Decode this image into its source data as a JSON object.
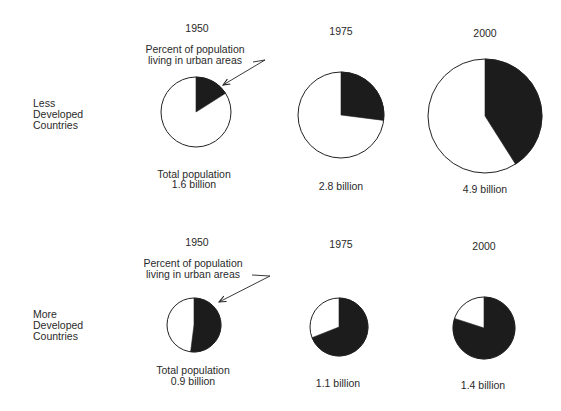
{
  "chart_data": {
    "type": "pie",
    "title": "",
    "annotation": "Percent of population living in urban areas",
    "groups": [
      {
        "name": "Less Developed Countries",
        "pies": [
          {
            "year": "1950",
            "total_population_billion": 1.6,
            "urban_percent": 16,
            "label": "Total population 1.6 billion"
          },
          {
            "year": "1975",
            "total_population_billion": 2.8,
            "urban_percent": 27,
            "label": "2.8 billion"
          },
          {
            "year": "2000",
            "total_population_billion": 4.9,
            "urban_percent": 41,
            "label": "4.9 billion"
          }
        ]
      },
      {
        "name": "More Developed Countries",
        "pies": [
          {
            "year": "1950",
            "total_population_billion": 0.9,
            "urban_percent": 52,
            "label": "Total population 0.9 billion"
          },
          {
            "year": "1975",
            "total_population_billion": 1.1,
            "urban_percent": 69,
            "label": "1.1 billion"
          },
          {
            "year": "2000",
            "total_population_billion": 1.4,
            "urban_percent": 80,
            "label": "1.4 billion"
          }
        ]
      }
    ],
    "legend": {
      "filled": "urban population",
      "empty": "non-urban population"
    },
    "note": "Pie area proportional to total population"
  },
  "labels": {
    "ldc": [
      "Less",
      "Developed",
      "Countries"
    ],
    "mdc": [
      "More",
      "Developed",
      "Countries"
    ],
    "annotation_line1": "Percent of population",
    "annotation_line2": "living in urban areas",
    "total_population": "Total population",
    "years": {
      "top": [
        "1950",
        "1975",
        "2000"
      ],
      "bottom": [
        "1950",
        "1975",
        "2000"
      ]
    },
    "values": {
      "top": [
        "1.6 billion",
        "2.8 billion",
        "4.9 billion"
      ],
      "bottom": [
        "0.9 billion",
        "1.1 billion",
        "1.4 billion"
      ]
    }
  },
  "colors": {
    "urban_fill": "#1c1c1c",
    "rural_fill": "#ffffff",
    "outline": "#222222",
    "text": "#2a2a2a"
  }
}
